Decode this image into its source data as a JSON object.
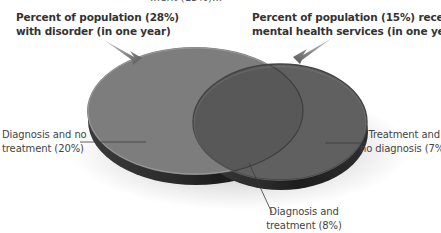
{
  "diagram": {
    "type": "venn",
    "cut_off_text": "...ent (15%)...",
    "sets": [
      {
        "id": "disorder",
        "title_lines": [
          "Percent of population (28%)",
          "with disorder (in one year)"
        ],
        "percent": 28,
        "color": "#7d7d7d"
      },
      {
        "id": "services",
        "title_lines": [
          "Percent of population (15%) receiving",
          "mental health services (in one year)"
        ],
        "percent": 15,
        "color": "#606060"
      }
    ],
    "regions": [
      {
        "id": "diagnosis-no-treatment",
        "lines": [
          "Diagnosis and no",
          "treatment (20%)"
        ],
        "percent": 20
      },
      {
        "id": "diagnosis-and-treatment",
        "lines": [
          "Diagnosis and",
          "treatment (8%)"
        ],
        "percent": 8,
        "color": "#585858"
      },
      {
        "id": "treatment-no-diagnosis",
        "lines": [
          "Treatment and",
          "no diagnosis (7%)"
        ],
        "percent": 7
      }
    ]
  }
}
